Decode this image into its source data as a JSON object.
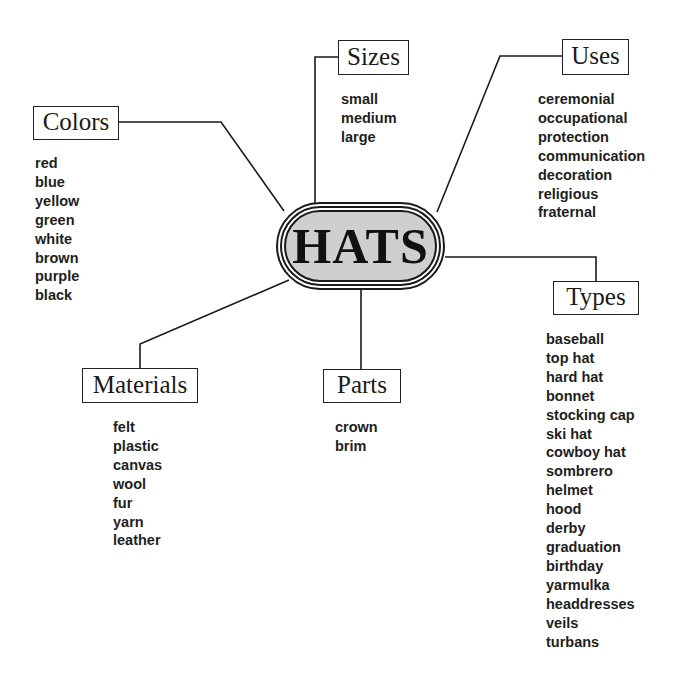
{
  "diagram": {
    "type": "mind-map",
    "center": {
      "label": "HATS",
      "fill": "#cfcfcf"
    },
    "branches": {
      "colors": {
        "label": "Colors",
        "items": [
          "red",
          "blue",
          "yellow",
          "green",
          "white",
          "brown",
          "purple",
          "black"
        ]
      },
      "sizes": {
        "label": "Sizes",
        "items": [
          "small",
          "medium",
          "large"
        ]
      },
      "uses": {
        "label": "Uses",
        "items": [
          "ceremonial",
          "occupational",
          "protection",
          "communication",
          "decoration",
          "religious",
          "fraternal"
        ]
      },
      "types": {
        "label": "Types",
        "items": [
          "baseball",
          "top hat",
          "hard hat",
          "bonnet",
          "stocking cap",
          "ski hat",
          "cowboy hat",
          "sombrero",
          "helmet",
          "hood",
          "derby",
          "graduation",
          "birthday",
          "yarmulka",
          "headdresses",
          "veils",
          "turbans"
        ]
      },
      "materials": {
        "label": "Materials",
        "items": [
          "felt",
          "plastic",
          "canvas",
          "wool",
          "fur",
          "yarn",
          "leather"
        ]
      },
      "parts": {
        "label": "Parts",
        "items": [
          "crown",
          "brim"
        ]
      }
    },
    "colors": {
      "line": "#1a1a1a",
      "text": "#1e1e1e",
      "background": "#ffffff"
    }
  }
}
